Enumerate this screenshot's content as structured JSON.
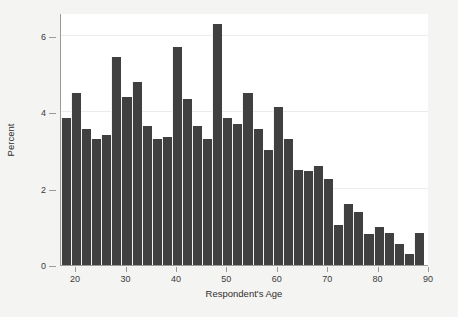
{
  "chart_data": {
    "type": "bar",
    "title": "",
    "subtitle": "",
    "xlabel": "Respondent's Age",
    "ylabel": "Percent",
    "xlim": [
      17,
      90
    ],
    "ylim": [
      0,
      6.6
    ],
    "x_ticks": [
      20,
      30,
      40,
      50,
      60,
      70,
      80,
      90
    ],
    "y_ticks": [
      0,
      2,
      4,
      6
    ],
    "grid": true,
    "grid_axis": "y",
    "legend": "none",
    "bar_color": "#404040",
    "bin_width": 2,
    "categories": [
      18,
      20,
      22,
      24,
      26,
      28,
      30,
      32,
      34,
      36,
      38,
      40,
      42,
      44,
      46,
      48,
      50,
      52,
      54,
      56,
      58,
      60,
      62,
      64,
      66,
      68,
      70,
      72,
      74,
      76,
      78,
      80,
      82,
      84,
      86,
      88
    ],
    "values": [
      3.85,
      4.5,
      3.55,
      3.3,
      3.4,
      5.45,
      4.4,
      4.8,
      3.65,
      3.3,
      3.35,
      5.7,
      4.35,
      3.65,
      3.3,
      6.3,
      3.85,
      3.7,
      4.5,
      3.55,
      3.0,
      4.15,
      3.3,
      2.5,
      2.45,
      2.6,
      2.25,
      1.05,
      1.6,
      1.4,
      0.8,
      1.0,
      0.85,
      0.55,
      0.3,
      0.85
    ],
    "annotations": []
  },
  "axes": {
    "y_tick_labels": [
      "0",
      "2",
      "4",
      "6"
    ],
    "x_tick_labels": [
      "20",
      "30",
      "40",
      "50",
      "60",
      "70",
      "80",
      "90"
    ],
    "y_title": "Percent",
    "x_title": "Respondent's Age"
  }
}
